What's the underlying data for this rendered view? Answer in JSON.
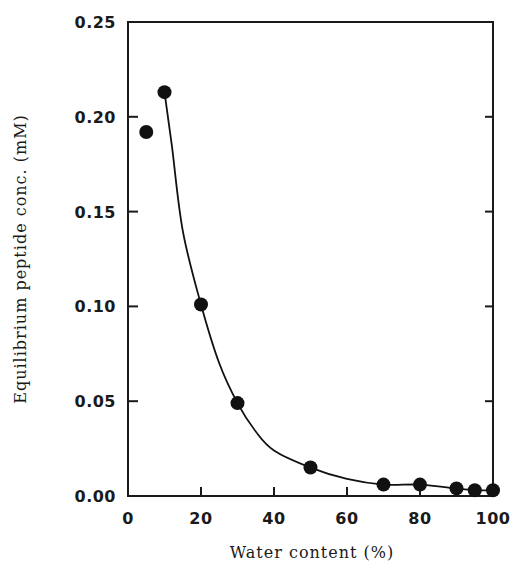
{
  "chart_data": {
    "type": "scatter",
    "title": "",
    "xlabel": "Water content (%)",
    "ylabel": "Equilibrium peptide conc. (mM)",
    "xlim": [
      0,
      100
    ],
    "ylim": [
      0,
      0.25
    ],
    "x_ticks": [
      0,
      20,
      40,
      60,
      80,
      100
    ],
    "x_tick_labels": [
      "0",
      "20",
      "40",
      "60",
      "80",
      "100"
    ],
    "y_ticks": [
      0.0,
      0.05,
      0.1,
      0.15,
      0.2,
      0.25
    ],
    "y_tick_labels": [
      "0.00",
      "0.05",
      "0.10",
      "0.15",
      "0.20",
      "0.25"
    ],
    "grid": false,
    "legend": null,
    "series": [
      {
        "name": "measured",
        "marker": "filled-circle",
        "color": "#111111",
        "x": [
          5,
          10,
          20,
          30,
          50,
          70,
          80,
          90,
          95,
          100
        ],
        "y": [
          0.192,
          0.213,
          0.101,
          0.049,
          0.015,
          0.006,
          0.006,
          0.004,
          0.003,
          0.003
        ]
      },
      {
        "name": "fitted-curve",
        "type": "line",
        "color": "#111111",
        "x": [
          10,
          12,
          15,
          20,
          25,
          30,
          35,
          40,
          50,
          60,
          70,
          80,
          90,
          95,
          100
        ],
        "y": [
          0.213,
          0.185,
          0.14,
          0.101,
          0.07,
          0.049,
          0.034,
          0.024,
          0.015,
          0.009,
          0.006,
          0.006,
          0.004,
          0.003,
          0.003
        ]
      }
    ]
  }
}
